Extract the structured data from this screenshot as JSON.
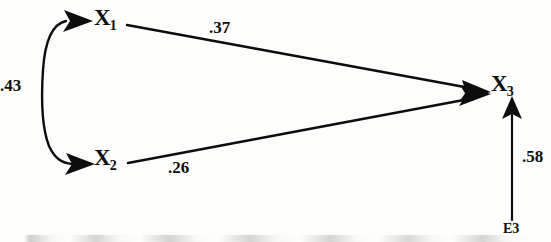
{
  "figure": {
    "type": "path-diagram",
    "background_color": "#fdfdfb",
    "stroke_color": "#0d0d0d"
  },
  "nodes": [
    {
      "id": "X1",
      "base": "X",
      "subscript": "1",
      "x": 94,
      "y": 6
    },
    {
      "id": "X2",
      "base": "X",
      "subscript": "2",
      "x": 94,
      "y": 146
    },
    {
      "id": "X3",
      "base": "X",
      "subscript": "3",
      "x": 491,
      "y": 72
    }
  ],
  "error_terms": [
    {
      "id": "E3",
      "label": "E3",
      "x": 503,
      "y": 222
    }
  ],
  "paths": [
    {
      "name": "x1-to-x3",
      "from": "X1",
      "to": "X3",
      "arrow": "single",
      "coefficient": ".37",
      "label_x": 209,
      "label_y": 19
    },
    {
      "name": "x2-to-x3",
      "from": "X2",
      "to": "X3",
      "arrow": "single",
      "coefficient": ".26",
      "label_x": 168,
      "label_y": 159
    },
    {
      "name": "x1-x2-correlation",
      "from": "X1",
      "to": "X2",
      "arrow": "double-curved",
      "coefficient": ".43",
      "label_x": 0,
      "label_y": 77
    },
    {
      "name": "e3-to-x3",
      "from": "E3",
      "to": "X3",
      "arrow": "single",
      "coefficient": ".58",
      "label_x": 522,
      "label_y": 148
    }
  ]
}
